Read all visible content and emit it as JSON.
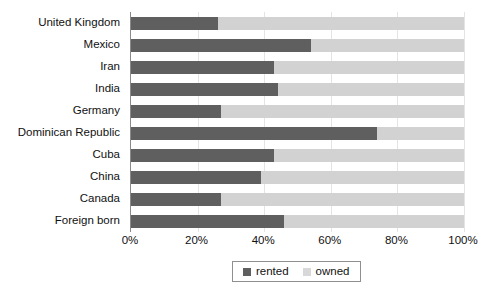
{
  "chart_data": {
    "type": "bar",
    "subtype": "stacked-horizontal-100pct",
    "title": "",
    "subtitle": "",
    "xlabel": "",
    "ylabel": "",
    "orientation": "horizontal",
    "stacked": true,
    "grid": true,
    "xlim": [
      0,
      100
    ],
    "xticks": [
      0,
      20,
      40,
      60,
      80,
      100
    ],
    "xtick_labels": [
      "0%",
      "20%",
      "40%",
      "60%",
      "80%",
      "100%"
    ],
    "legend_position": "bottom-center",
    "categories": [
      "United Kingdom",
      "Mexico",
      "Iran",
      "India",
      "Germany",
      "Dominican Republic",
      "Cuba",
      "China",
      "Canada",
      "Foreign born"
    ],
    "series": [
      {
        "name": "rented",
        "color": "#5f5f5f",
        "values": [
          26,
          54,
          43,
          44,
          27,
          74,
          43,
          39,
          27,
          46
        ]
      },
      {
        "name": "owned",
        "color": "#d2d2d2",
        "values": [
          74,
          46,
          57,
          56,
          73,
          26,
          57,
          61,
          73,
          54
        ]
      }
    ]
  },
  "legend": {
    "items": [
      {
        "label": "rented",
        "swatch": "rented"
      },
      {
        "label": "owned",
        "swatch": "owned"
      }
    ]
  }
}
